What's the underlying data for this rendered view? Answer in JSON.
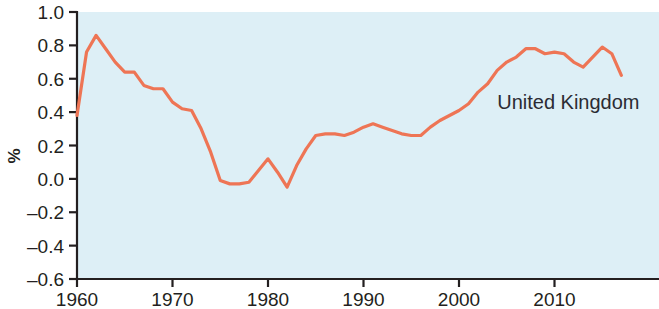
{
  "chart_data": {
    "type": "line",
    "title": "",
    "subtitle": "",
    "xlabel": "",
    "ylabel": "%",
    "xlim": [
      1960,
      2017
    ],
    "ylim": [
      -0.6,
      1.0
    ],
    "grid": false,
    "legend_position": "inline-annotation",
    "annotations": [
      {
        "text": "United Kingdom",
        "x": 2004,
        "y": 0.42
      }
    ],
    "xticks": [
      1960,
      1970,
      1980,
      1990,
      2000,
      2010
    ],
    "xtick_labels": [
      "1960",
      "1970",
      "1980",
      "1990",
      "2000",
      "2010"
    ],
    "yticks": [
      -0.6,
      -0.4,
      -0.2,
      0.0,
      0.2,
      0.4,
      0.6,
      0.8,
      1.0
    ],
    "ytick_labels": [
      "–0.6",
      "–0.4",
      "–0.2",
      "0.0",
      "0.2",
      "0.4",
      "0.6",
      "0.8",
      "1.0"
    ],
    "series": [
      {
        "name": "United Kingdom",
        "color": "#ee7555",
        "x": [
          1960,
          1961,
          1962,
          1963,
          1964,
          1965,
          1966,
          1967,
          1968,
          1969,
          1970,
          1971,
          1972,
          1973,
          1974,
          1975,
          1976,
          1977,
          1978,
          1979,
          1980,
          1981,
          1982,
          1983,
          1984,
          1985,
          1986,
          1987,
          1988,
          1989,
          1990,
          1991,
          1992,
          1993,
          1994,
          1995,
          1996,
          1997,
          1998,
          1999,
          2000,
          2001,
          2002,
          2003,
          2004,
          2005,
          2006,
          2007,
          2008,
          2009,
          2010,
          2011,
          2012,
          2013,
          2014,
          2015,
          2016,
          2017
        ],
        "y": [
          0.38,
          0.76,
          0.86,
          0.78,
          0.7,
          0.64,
          0.64,
          0.56,
          0.54,
          0.54,
          0.46,
          0.42,
          0.41,
          0.3,
          0.16,
          -0.01,
          -0.03,
          -0.03,
          -0.02,
          0.05,
          0.12,
          0.04,
          -0.05,
          0.08,
          0.18,
          0.26,
          0.27,
          0.27,
          0.26,
          0.28,
          0.31,
          0.33,
          0.31,
          0.29,
          0.27,
          0.26,
          0.26,
          0.31,
          0.35,
          0.38,
          0.41,
          0.45,
          0.52,
          0.57,
          0.65,
          0.7,
          0.73,
          0.78,
          0.78,
          0.75,
          0.76,
          0.75,
          0.7,
          0.67,
          0.73,
          0.79,
          0.75,
          0.62
        ]
      }
    ],
    "colors": {
      "line": "#ee7555",
      "plot_background": "#ddeff6",
      "figure_background": "#ffffff",
      "axis": "#231f20",
      "text": "#231f20"
    }
  },
  "axis": {
    "ylabel": "%"
  }
}
